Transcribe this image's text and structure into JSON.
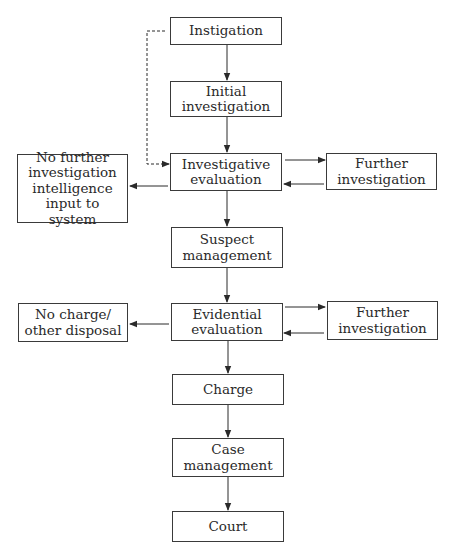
{
  "diagram": {
    "type": "flowchart",
    "colors": {
      "line": "#2a2a2a",
      "box_border": "#3a3a3a",
      "background": "#ffffff",
      "text": "#2a2a2a"
    },
    "nodes": {
      "instigation": {
        "label": "Instigation"
      },
      "initial_investigation": {
        "label": "Initial\ninvestigation"
      },
      "investigative_evaluation": {
        "label": "Investigative\nevaluation"
      },
      "no_further_investigation": {
        "label": "No further\ninvestigation\nintelligence\ninput to system"
      },
      "further_investigation_1": {
        "label": "Further\ninvestigation"
      },
      "suspect_management": {
        "label": "Suspect\nmanagement"
      },
      "evidential_evaluation": {
        "label": "Evidential\nevaluation"
      },
      "no_charge": {
        "label": "No charge/\nother disposal"
      },
      "further_investigation_2": {
        "label": "Further\ninvestigation"
      },
      "charge": {
        "label": "Charge"
      },
      "case_management": {
        "label": "Case\nmanagement"
      },
      "court": {
        "label": "Court"
      }
    },
    "edges": [
      {
        "from": "instigation",
        "to": "initial_investigation",
        "style": "solid"
      },
      {
        "from": "instigation",
        "to": "investigative_evaluation",
        "style": "dashed"
      },
      {
        "from": "initial_investigation",
        "to": "investigative_evaluation",
        "style": "solid"
      },
      {
        "from": "investigative_evaluation",
        "to": "further_investigation_1",
        "style": "solid"
      },
      {
        "from": "further_investigation_1",
        "to": "investigative_evaluation",
        "style": "solid"
      },
      {
        "from": "investigative_evaluation",
        "to": "no_further_investigation",
        "style": "solid"
      },
      {
        "from": "investigative_evaluation",
        "to": "suspect_management",
        "style": "solid"
      },
      {
        "from": "suspect_management",
        "to": "evidential_evaluation",
        "style": "solid"
      },
      {
        "from": "evidential_evaluation",
        "to": "further_investigation_2",
        "style": "solid"
      },
      {
        "from": "further_investigation_2",
        "to": "evidential_evaluation",
        "style": "solid"
      },
      {
        "from": "evidential_evaluation",
        "to": "no_charge",
        "style": "solid"
      },
      {
        "from": "evidential_evaluation",
        "to": "charge",
        "style": "solid"
      },
      {
        "from": "charge",
        "to": "case_management",
        "style": "solid"
      },
      {
        "from": "case_management",
        "to": "court",
        "style": "solid"
      }
    ]
  }
}
